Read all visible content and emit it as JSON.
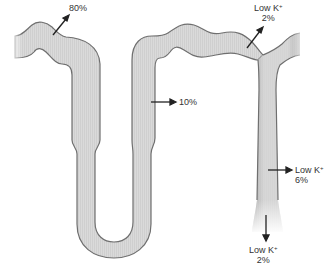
{
  "diagram": {
    "type": "nephron potassium handling",
    "colors": {
      "tubule_fill": "#d9d9d9",
      "tubule_stroke": "#6f6f6f",
      "arrow": "#222222",
      "text": "#333333"
    },
    "labels": {
      "proximal": {
        "value": "80%"
      },
      "loop": {
        "value": "10%"
      },
      "distal": {
        "prefix": "Low K",
        "sup": "+",
        "value": "2%"
      },
      "collecting": {
        "prefix": "Low K",
        "sup": "+",
        "value": "6%"
      },
      "urine": {
        "prefix": "Low K",
        "sup": "+",
        "value": "2%"
      }
    }
  }
}
